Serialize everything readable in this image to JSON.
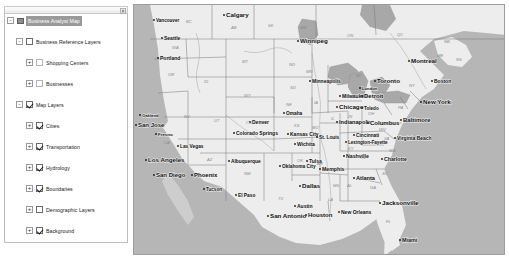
{
  "toc": {
    "close_label": "×",
    "nodes": [
      {
        "depth": 0,
        "toggle": "-",
        "icon": "map-layer-icon",
        "label": "Business Analyst Map",
        "state": "selected",
        "checkbox": "none"
      },
      {
        "depth": 1,
        "toggle": "-",
        "label": "Business Reference Layers",
        "checkbox": "off"
      },
      {
        "depth": 2,
        "toggle": "+",
        "label": "Shopping Centers",
        "checkbox": "dim"
      },
      {
        "depth": 2,
        "toggle": "+",
        "label": "Businesses",
        "checkbox": "dim"
      },
      {
        "depth": 1,
        "toggle": "-",
        "label": "Map Layers",
        "checkbox": "on"
      },
      {
        "depth": 2,
        "toggle": "+",
        "label": "Cities",
        "checkbox": "on"
      },
      {
        "depth": 2,
        "toggle": "+",
        "label": "Transportation",
        "checkbox": "on"
      },
      {
        "depth": 2,
        "toggle": "+",
        "label": "Hydrology",
        "checkbox": "on"
      },
      {
        "depth": 2,
        "toggle": "+",
        "label": "Boundaries",
        "checkbox": "on"
      },
      {
        "depth": 2,
        "toggle": "+",
        "label": "Demographic Layers",
        "checkbox": "off"
      },
      {
        "depth": 2,
        "toggle": "+",
        "label": "Background",
        "checkbox": "on"
      }
    ]
  },
  "map": {
    "colors": {
      "ocean": "#b6b6b6",
      "land": "#ededed",
      "border": "#777777",
      "water": "#a8a8a8",
      "city_text": "#111111",
      "state_text": "#8a8a8a"
    },
    "cities": [
      {
        "name": "Vancouver",
        "x": 22,
        "y": 17,
        "size": 4.6
      },
      {
        "name": "Calgary",
        "x": 92,
        "y": 12,
        "size": 6.2
      },
      {
        "name": "Seattle",
        "x": 30,
        "y": 35,
        "size": 5.0
      },
      {
        "name": "Portland",
        "x": 26,
        "y": 55,
        "size": 5.0
      },
      {
        "name": "Winnipeg",
        "x": 166,
        "y": 38,
        "size": 6.2
      },
      {
        "name": "Oakland",
        "x": 8,
        "y": 112,
        "size": 4.2
      },
      {
        "name": "San Jose",
        "x": 4,
        "y": 122,
        "size": 6.0
      },
      {
        "name": "Fresno",
        "x": 24,
        "y": 131,
        "size": 4.4
      },
      {
        "name": "Las Vegas",
        "x": 46,
        "y": 143,
        "size": 4.8
      },
      {
        "name": "Los Angeles",
        "x": 14,
        "y": 157,
        "size": 6.2
      },
      {
        "name": "San Diego",
        "x": 22,
        "y": 172,
        "size": 6.0
      },
      {
        "name": "Phoenix",
        "x": 60,
        "y": 172,
        "size": 6.0
      },
      {
        "name": "Tucson",
        "x": 72,
        "y": 186,
        "size": 4.6
      },
      {
        "name": "Denver",
        "x": 118,
        "y": 119,
        "size": 5.0
      },
      {
        "name": "Colorado Springs",
        "x": 102,
        "y": 130,
        "size": 5.0
      },
      {
        "name": "Albuquerque",
        "x": 97,
        "y": 158,
        "size": 4.8
      },
      {
        "name": "El Paso",
        "x": 104,
        "y": 192,
        "size": 4.8
      },
      {
        "name": "Wichita",
        "x": 163,
        "y": 141,
        "size": 5.0
      },
      {
        "name": "Oklahoma City",
        "x": 148,
        "y": 163,
        "size": 4.8
      },
      {
        "name": "Tulsa",
        "x": 175,
        "y": 158,
        "size": 5.0
      },
      {
        "name": "Kansas City",
        "x": 156,
        "y": 131,
        "size": 5.0
      },
      {
        "name": "Omaha",
        "x": 152,
        "y": 110,
        "size": 4.8
      },
      {
        "name": "Dallas",
        "x": 168,
        "y": 183,
        "size": 6.2
      },
      {
        "name": "Austin",
        "x": 163,
        "y": 203,
        "size": 5.0
      },
      {
        "name": "San Antonio",
        "x": 136,
        "y": 213,
        "size": 6.2
      },
      {
        "name": "Houston",
        "x": 174,
        "y": 212,
        "size": 6.0
      },
      {
        "name": "New Orleans",
        "x": 207,
        "y": 209,
        "size": 5.0
      },
      {
        "name": "Minneapolis",
        "x": 178,
        "y": 78,
        "size": 5.0
      },
      {
        "name": "Milwaukee",
        "x": 208,
        "y": 93,
        "size": 5.0
      },
      {
        "name": "Chicago",
        "x": 205,
        "y": 104,
        "size": 6.2
      },
      {
        "name": "Toledo",
        "x": 230,
        "y": 105,
        "size": 4.6
      },
      {
        "name": "Indianapolis",
        "x": 205,
        "y": 119,
        "size": 5.6
      },
      {
        "name": "Detroit",
        "x": 230,
        "y": 93,
        "size": 6.0
      },
      {
        "name": "London",
        "x": 228,
        "y": 85,
        "size": 4.2
      },
      {
        "name": "Toronto",
        "x": 243,
        "y": 78,
        "size": 6.2
      },
      {
        "name": "Montreal",
        "x": 277,
        "y": 58,
        "size": 6.2
      },
      {
        "name": "Boston",
        "x": 300,
        "y": 78,
        "size": 5.0
      },
      {
        "name": "New York",
        "x": 289,
        "y": 99,
        "size": 6.2
      },
      {
        "name": "Columbus",
        "x": 236,
        "y": 120,
        "size": 6.0
      },
      {
        "name": "Baltimore",
        "x": 269,
        "y": 117,
        "size": 6.0
      },
      {
        "name": "Cincinnati",
        "x": 222,
        "y": 132,
        "size": 4.8
      },
      {
        "name": "Lexington-Fayette",
        "x": 214,
        "y": 139,
        "size": 4.6
      },
      {
        "name": "Virginia Beach",
        "x": 263,
        "y": 135,
        "size": 5.0
      },
      {
        "name": "St. Louis",
        "x": 185,
        "y": 134,
        "size": 4.8
      },
      {
        "name": "Nashville",
        "x": 212,
        "y": 153,
        "size": 5.2
      },
      {
        "name": "Charlotte",
        "x": 250,
        "y": 156,
        "size": 5.2
      },
      {
        "name": "Memphis",
        "x": 188,
        "y": 166,
        "size": 5.2
      },
      {
        "name": "Atlanta",
        "x": 222,
        "y": 175,
        "size": 5.6
      },
      {
        "name": "Jacksonville",
        "x": 248,
        "y": 200,
        "size": 6.2
      },
      {
        "name": "Miami",
        "x": 268,
        "y": 237,
        "size": 5.4
      }
    ],
    "states": [
      {
        "abbr": "BC",
        "x": 52,
        "y": 18
      },
      {
        "abbr": "AB",
        "x": 97,
        "y": 24
      },
      {
        "abbr": "SK",
        "x": 134,
        "y": 22
      },
      {
        "abbr": "MB",
        "x": 166,
        "y": 24
      },
      {
        "abbr": "ON",
        "x": 213,
        "y": 32
      },
      {
        "abbr": "QC",
        "x": 263,
        "y": 31
      },
      {
        "abbr": "NB",
        "x": 310,
        "y": 38
      },
      {
        "abbr": "ME",
        "x": 303,
        "y": 52
      },
      {
        "abbr": "WA",
        "x": 38,
        "y": 44
      },
      {
        "abbr": "OR",
        "x": 34,
        "y": 71
      },
      {
        "abbr": "ID",
        "x": 70,
        "y": 78
      },
      {
        "abbr": "MT",
        "x": 108,
        "y": 58
      },
      {
        "abbr": "ND",
        "x": 155,
        "y": 61
      },
      {
        "abbr": "SD",
        "x": 156,
        "y": 84
      },
      {
        "abbr": "NE",
        "x": 152,
        "y": 101
      },
      {
        "abbr": "WY",
        "x": 110,
        "y": 92
      },
      {
        "abbr": "NV",
        "x": 50,
        "y": 113
      },
      {
        "abbr": "UT",
        "x": 80,
        "y": 117
      },
      {
        "abbr": "CO",
        "x": 112,
        "y": 119
      },
      {
        "abbr": "CA",
        "x": 30,
        "y": 139
      },
      {
        "abbr": "AZ",
        "x": 73,
        "y": 156
      },
      {
        "abbr": "NM",
        "x": 110,
        "y": 170
      },
      {
        "abbr": "KS",
        "x": 160,
        "y": 122
      },
      {
        "abbr": "OK",
        "x": 163,
        "y": 157
      },
      {
        "abbr": "TX",
        "x": 144,
        "y": 195
      },
      {
        "abbr": "MN",
        "x": 172,
        "y": 68
      },
      {
        "abbr": "IA",
        "x": 180,
        "y": 99
      },
      {
        "abbr": "MO",
        "x": 178,
        "y": 124
      },
      {
        "abbr": "WI",
        "x": 196,
        "y": 78
      },
      {
        "abbr": "MI",
        "x": 222,
        "y": 72
      },
      {
        "abbr": "IL",
        "x": 197,
        "y": 115
      },
      {
        "abbr": "IN",
        "x": 214,
        "y": 113
      },
      {
        "abbr": "OH",
        "x": 234,
        "y": 110
      },
      {
        "abbr": "KY",
        "x": 214,
        "y": 145
      },
      {
        "abbr": "TN",
        "x": 226,
        "y": 154
      },
      {
        "abbr": "AR",
        "x": 183,
        "y": 160
      },
      {
        "abbr": "LA",
        "x": 194,
        "y": 196
      },
      {
        "abbr": "MS",
        "x": 199,
        "y": 182
      },
      {
        "abbr": "AL",
        "x": 213,
        "y": 182
      },
      {
        "abbr": "GA",
        "x": 236,
        "y": 184
      },
      {
        "abbr": "FL",
        "x": 252,
        "y": 218
      },
      {
        "abbr": "SC",
        "x": 248,
        "y": 170
      },
      {
        "abbr": "NC",
        "x": 255,
        "y": 147
      },
      {
        "abbr": "VA",
        "x": 250,
        "y": 135
      },
      {
        "abbr": "WV",
        "x": 245,
        "y": 126
      },
      {
        "abbr": "PA",
        "x": 264,
        "y": 104
      },
      {
        "abbr": "NY",
        "x": 275,
        "y": 82
      },
      {
        "abbr": "NS",
        "x": 322,
        "y": 56
      }
    ]
  }
}
